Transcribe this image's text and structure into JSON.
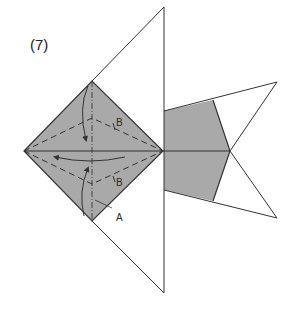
{
  "diagram": {
    "step_label": "(7)",
    "labels": {
      "b_upper": "B",
      "b_lower": "B",
      "a": "A"
    },
    "colors": {
      "paper_shaded": "#a9a9a9",
      "paper_white": "#ffffff",
      "line": "#333333"
    },
    "line_types": {
      "valley_fold": "dashed",
      "mountain_fold": "dash-dot",
      "edge": "solid"
    },
    "arrows": [
      {
        "name": "fold-upper-flap-down",
        "description": "curved arrow from top vertex down toward center"
      },
      {
        "name": "fold-lower-flap-up",
        "description": "curved arrow from bottom vertex up toward center"
      },
      {
        "name": "fold-right-to-left",
        "description": "long curved arrow pointing left across center"
      }
    ]
  }
}
